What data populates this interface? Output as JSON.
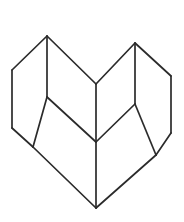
{
  "figure": {
    "title": "",
    "caption": "",
    "background_color": "#ffffff",
    "stroke_color": "#2b2b2b",
    "stroke_width": 1.7,
    "canvas": {
      "width": 184,
      "height": 222
    },
    "vertices": {
      "left_apex": [
        47,
        36
      ],
      "right_apex": [
        135,
        43
      ],
      "left_outer_top": [
        12,
        70
      ],
      "left_outer_bottom": [
        12,
        128
      ],
      "right_outer_top": [
        171,
        76
      ],
      "right_outer_bottom": [
        171,
        133
      ],
      "center_notch": [
        96,
        84
      ],
      "center_middle": [
        96,
        142
      ],
      "bottom_apex": [
        96,
        208
      ],
      "left_inner_junction": [
        47,
        97
      ],
      "right_inner_junction": [
        135,
        104
      ],
      "left_lower_junction": [
        33,
        147
      ],
      "right_lower_junction": [
        156,
        155
      ]
    },
    "edges": [
      {
        "name": "left-upper-outer",
        "from": "left_apex",
        "to": "left_outer_top"
      },
      {
        "name": "left-outer-vertical",
        "from": "left_outer_top",
        "to": "left_outer_bottom"
      },
      {
        "name": "left-outer-lower",
        "from": "left_outer_bottom",
        "to": "left_lower_junction"
      },
      {
        "name": "left-apex-to-notch",
        "from": "left_apex",
        "to": "center_notch"
      },
      {
        "name": "left-apex-vertical",
        "from": "left_apex",
        "to": "left_inner_junction"
      },
      {
        "name": "left-inner-to-outer",
        "from": "left_inner_junction",
        "to": "left_lower_junction"
      },
      {
        "name": "left-inner-to-middle",
        "from": "left_inner_junction",
        "to": "center_middle"
      },
      {
        "name": "left-lower-to-bottom",
        "from": "left_lower_junction",
        "to": "bottom_apex"
      },
      {
        "name": "center-vertical-upper",
        "from": "center_notch",
        "to": "center_middle"
      },
      {
        "name": "center-vertical-lower",
        "from": "center_middle",
        "to": "bottom_apex"
      },
      {
        "name": "right-apex-to-notch",
        "from": "right_apex",
        "to": "center_notch"
      },
      {
        "name": "right-upper-outer",
        "from": "right_apex",
        "to": "right_outer_top"
      },
      {
        "name": "right-outer-vertical",
        "from": "right_outer_top",
        "to": "right_outer_bottom"
      },
      {
        "name": "right-outer-lower",
        "from": "right_outer_bottom",
        "to": "right_lower_junction"
      },
      {
        "name": "right-apex-vertical",
        "from": "right_apex",
        "to": "right_inner_junction"
      },
      {
        "name": "right-inner-to-outer",
        "from": "right_inner_junction",
        "to": "right_lower_junction"
      },
      {
        "name": "right-inner-to-middle",
        "from": "right_inner_junction",
        "to": "center_middle"
      },
      {
        "name": "right-lower-to-bottom",
        "from": "right_lower_junction",
        "to": "bottom_apex"
      }
    ],
    "faces": [
      {
        "name": "left-outer-face",
        "points": "47,36 12,70 12,128 33,147 47,97"
      },
      {
        "name": "left-top-face",
        "points": "47,36 96,84 96,142 47,97"
      },
      {
        "name": "left-bottom-face",
        "points": "47,97 33,147 96,208 96,142"
      },
      {
        "name": "right-outer-face",
        "points": "135,43 171,76 171,133 156,155 135,104"
      },
      {
        "name": "right-top-face",
        "points": "135,43 96,84 96,142 135,104"
      },
      {
        "name": "right-bottom-face",
        "points": "135,104 156,155 96,208 96,142"
      }
    ]
  }
}
